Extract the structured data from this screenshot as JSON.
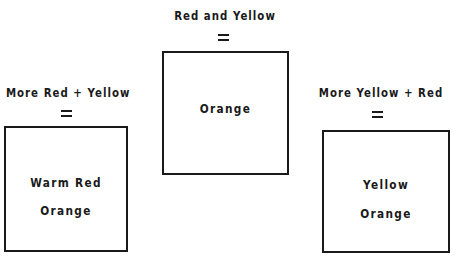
{
  "diagram": {
    "groups": [
      {
        "id": "center",
        "heading": "Red and Yellow",
        "equals": "=",
        "result_lines": [
          "Orange"
        ]
      },
      {
        "id": "left",
        "heading": "More Red + Yellow",
        "equals": "=",
        "result_lines": [
          "Warm Red",
          "Orange"
        ]
      },
      {
        "id": "right",
        "heading": "More Yellow + Red",
        "equals": "=",
        "result_lines": [
          "Yellow",
          "Orange"
        ]
      }
    ],
    "colors": {
      "ink": "#1a1a1a",
      "background": "#ffffff"
    }
  }
}
